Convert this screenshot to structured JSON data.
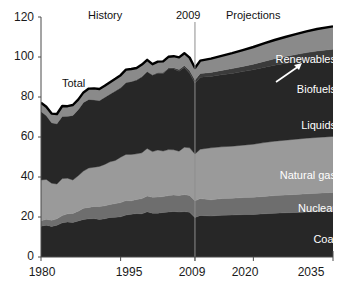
{
  "chart_data": {
    "type": "area",
    "title": "",
    "subtitle": "",
    "xlabel": "",
    "ylabel": "",
    "xlim": [
      1980,
      2035
    ],
    "ylim": [
      0,
      120
    ],
    "grid": false,
    "legend_position": "inline-right",
    "stacked": true,
    "xticks": [
      "1980",
      "1995",
      "2009",
      "2020",
      "2035"
    ],
    "xtick_values": [
      1980,
      1995,
      2009,
      2020,
      2035
    ],
    "yticks": [
      "0",
      "20",
      "40",
      "60",
      "80",
      "100",
      "120"
    ],
    "ytick_values": [
      0,
      20,
      40,
      60,
      80,
      100,
      120
    ],
    "annotations": [
      {
        "text": "History",
        "x": 1992,
        "y": 118
      },
      {
        "text": "2009",
        "x": 2009,
        "y": 118
      },
      {
        "text": "Projections",
        "x": 2021,
        "y": 118
      },
      {
        "text": "Total",
        "x": 1987,
        "y": 87
      }
    ],
    "divider_year": 2009,
    "x": [
      1980,
      1981,
      1982,
      1983,
      1984,
      1985,
      1986,
      1987,
      1988,
      1989,
      1990,
      1991,
      1992,
      1993,
      1994,
      1995,
      1996,
      1997,
      1998,
      1999,
      2000,
      2001,
      2002,
      2003,
      2004,
      2005,
      2006,
      2007,
      2008,
      2009,
      2010,
      2012,
      2014,
      2016,
      2018,
      2020,
      2022,
      2024,
      2026,
      2028,
      2030,
      2032,
      2035
    ],
    "series": [
      {
        "name": "Coal",
        "color": "#272727",
        "values": [
          15.4,
          15.9,
          15.3,
          15.9,
          17.1,
          17.5,
          17.3,
          18.0,
          18.8,
          19.1,
          19.2,
          18.8,
          19.1,
          19.8,
          19.9,
          20.1,
          21.0,
          21.4,
          21.7,
          21.6,
          22.6,
          21.9,
          21.9,
          22.3,
          22.5,
          22.8,
          22.5,
          22.7,
          22.4,
          19.7,
          20.8,
          20.5,
          20.9,
          21.0,
          21.2,
          21.3,
          21.6,
          21.9,
          22.1,
          22.3,
          22.5,
          22.7,
          23.0
        ]
      },
      {
        "name": "Nuclear",
        "color": "#6e6e6e",
        "values": [
          2.7,
          3.0,
          3.1,
          3.2,
          3.6,
          4.1,
          4.5,
          4.9,
          5.6,
          5.7,
          6.1,
          6.4,
          6.5,
          6.5,
          6.8,
          7.1,
          7.2,
          6.7,
          7.1,
          7.6,
          7.9,
          8.0,
          8.1,
          7.9,
          8.2,
          8.2,
          8.2,
          8.5,
          8.4,
          8.4,
          8.4,
          8.1,
          8.3,
          8.4,
          8.5,
          8.6,
          8.7,
          8.8,
          8.9,
          9.0,
          9.1,
          9.2,
          9.3
        ]
      },
      {
        "name": "Natural gas",
        "color": "#9a9a9a",
        "values": [
          20.4,
          19.9,
          18.5,
          17.4,
          18.5,
          17.8,
          16.7,
          17.7,
          18.6,
          19.7,
          19.6,
          20.1,
          20.7,
          21.3,
          21.6,
          22.7,
          23.1,
          23.2,
          22.8,
          22.9,
          23.8,
          22.8,
          23.5,
          22.8,
          23.0,
          22.6,
          22.2,
          23.7,
          23.8,
          23.4,
          24.7,
          26.0,
          25.9,
          26.0,
          26.2,
          26.5,
          26.9,
          27.2,
          27.4,
          27.6,
          27.8,
          27.9,
          28.0
        ]
      },
      {
        "name": "Liquids",
        "color": "#272727",
        "values": [
          34.2,
          31.9,
          30.2,
          30.1,
          31.1,
          30.9,
          32.2,
          32.9,
          34.2,
          34.2,
          33.6,
          32.8,
          33.5,
          33.8,
          34.6,
          34.6,
          35.8,
          36.3,
          36.8,
          37.9,
          38.3,
          38.2,
          38.4,
          38.8,
          40.3,
          40.4,
          40.0,
          39.8,
          37.3,
          35.4,
          36.0,
          35.7,
          36.0,
          36.4,
          36.8,
          37.2,
          37.6,
          38.0,
          38.4,
          38.7,
          39.0,
          39.2,
          39.4
        ]
      },
      {
        "name": "Biofuels",
        "color": "#3b3b3b",
        "values": [
          0.0,
          0.0,
          0.0,
          0.0,
          0.0,
          0.1,
          0.1,
          0.1,
          0.1,
          0.1,
          0.1,
          0.1,
          0.1,
          0.1,
          0.2,
          0.2,
          0.2,
          0.2,
          0.2,
          0.2,
          0.2,
          0.2,
          0.3,
          0.4,
          0.5,
          0.6,
          0.8,
          1.0,
          1.4,
          1.6,
          1.8,
          2.0,
          2.2,
          2.4,
          2.6,
          2.8,
          3.0,
          3.2,
          3.4,
          3.6,
          3.8,
          4.0,
          4.2
        ]
      },
      {
        "name": "Renewables",
        "color": "#8a8a8a",
        "values": [
          4.5,
          4.4,
          4.6,
          4.9,
          5.2,
          5.0,
          5.2,
          5.1,
          5.0,
          5.4,
          5.7,
          5.8,
          5.7,
          5.9,
          6.0,
          6.2,
          6.4,
          6.2,
          5.9,
          6.0,
          5.8,
          5.3,
          5.5,
          5.6,
          5.6,
          5.8,
          6.1,
          6.2,
          6.4,
          6.0,
          6.5,
          6.9,
          7.3,
          7.7,
          8.1,
          8.6,
          9.0,
          9.4,
          9.8,
          10.2,
          10.6,
          11.0,
          11.4
        ]
      }
    ],
    "band_labels": [
      {
        "name": "Renewables",
        "color": "#ffffff"
      },
      {
        "name": "Biofuels",
        "color": "#ffffff"
      },
      {
        "name": "Liquids",
        "color": "#ffffff"
      },
      {
        "name": "Natural gas",
        "color": "#ffffff"
      },
      {
        "name": "Nuclear",
        "color": "#ffffff"
      },
      {
        "name": "Coal",
        "color": "#ffffff"
      }
    ],
    "colors": {
      "coal": "#272727",
      "nuclear": "#6e6e6e",
      "natural_gas": "#9a9a9a",
      "liquids": "#272727",
      "biofuels": "#3b3b3b",
      "renewables": "#8a8a8a",
      "total_outline": "#000000",
      "axis": "#4a4a4a",
      "divider": "#8e8e8e",
      "background": "#ffffff"
    }
  },
  "labels": {
    "history": "History",
    "divider_year": "2009",
    "projections": "Projections",
    "total": "Total",
    "renewables": "Renewables",
    "biofuels": "Biofuels",
    "liquids": "Liquids",
    "natural_gas": "Natural gas",
    "nuclear": "Nuclear",
    "coal": "Coal"
  },
  "yticks": {
    "t0": "0",
    "t20": "20",
    "t40": "40",
    "t60": "60",
    "t80": "80",
    "t100": "100",
    "t120": "120"
  },
  "xticks": {
    "t1980": "1980",
    "t1995": "1995",
    "t2009": "2009",
    "t2020": "2020",
    "t2035": "2035"
  }
}
